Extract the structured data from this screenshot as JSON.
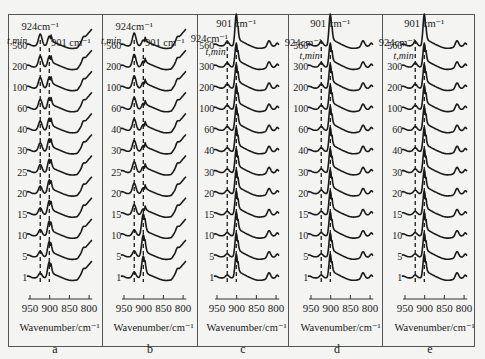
{
  "figure": {
    "x_axis_label": "Wavenumber/cm⁻¹",
    "x_ticks": [
      "950",
      "900",
      "850",
      "800"
    ],
    "time_header": "t,min",
    "peak_924_label": "924cm⁻¹",
    "peak_901_label": "901 cm⁻¹"
  },
  "panels": [
    {
      "letter": "a",
      "times": [
        "560",
        "200",
        "100",
        "60",
        "40",
        "30",
        "25",
        "20",
        "15",
        "10",
        "5",
        "1"
      ],
      "peak_924_rel": 1.0,
      "peak_901_rel": 0.7,
      "tail_rise": 1.0,
      "header_style": "924-top"
    },
    {
      "letter": "b",
      "times": [
        "560",
        "200",
        "100",
        "60",
        "40",
        "30",
        "25",
        "20",
        "15",
        "10",
        "5",
        "1"
      ],
      "peak_924_rel": 1.0,
      "peak_901_rel": 0.5,
      "tail_rise": 1.0,
      "header_style": "924-top"
    },
    {
      "letter": "c",
      "times": [
        "560",
        "300",
        "200",
        "100",
        "60",
        "40",
        "30",
        "20",
        "15",
        "10",
        "5",
        "1"
      ],
      "peak_924_rel": 0.3,
      "peak_901_rel": 1.0,
      "tail_rise": 0.3,
      "header_style": "901-top"
    },
    {
      "letter": "d",
      "times": [
        "560",
        "300",
        "200",
        "100",
        "60",
        "40",
        "30",
        "20",
        "15",
        "10",
        "5",
        "1"
      ],
      "peak_924_rel": 0.3,
      "peak_901_rel": 1.0,
      "tail_rise": 0.4,
      "header_style": "901-top"
    },
    {
      "letter": "e",
      "times": [
        "560",
        "300",
        "200",
        "100",
        "60",
        "40",
        "30",
        "20",
        "15",
        "10",
        "5",
        "1"
      ],
      "peak_924_rel": 0.3,
      "peak_901_rel": 1.0,
      "tail_rise": 0.4,
      "header_style": "901-top"
    }
  ],
  "chart_data": [
    {
      "type": "line",
      "title": "a",
      "xlabel": "Wavenumber/cm⁻¹",
      "ylabel": "t,min (stacked spectra)",
      "xlim": [
        960,
        790
      ],
      "x_ticks": [
        950,
        900,
        850,
        800
      ],
      "series_labels": [
        "560",
        "200",
        "100",
        "60",
        "40",
        "30",
        "25",
        "20",
        "15",
        "10",
        "5",
        "1"
      ],
      "annotations": [
        "924cm⁻¹",
        "901 cm⁻¹"
      ],
      "notes": "924 cm-1 band grows with time and dominates at long times; 901 cm-1 band strong at early times; dashed lines mark 924 and 901"
    },
    {
      "type": "line",
      "title": "b",
      "xlabel": "Wavenumber/cm⁻¹",
      "xlim": [
        960,
        790
      ],
      "x_ticks": [
        950,
        900,
        850,
        800
      ],
      "series_labels": [
        "560",
        "200",
        "100",
        "60",
        "40",
        "30",
        "25",
        "20",
        "15",
        "10",
        "5",
        "1"
      ],
      "annotations": [
        "924cm⁻¹",
        "901 cm⁻¹"
      ],
      "notes": "901 cm-1 dominant for t<=10 min; 924 cm-1 dominant for t>=15 min"
    },
    {
      "type": "line",
      "title": "c",
      "xlabel": "Wavenumber/cm⁻¹",
      "xlim": [
        960,
        790
      ],
      "x_ticks": [
        950,
        900,
        850,
        800
      ],
      "series_labels": [
        "560",
        "300",
        "200",
        "100",
        "60",
        "40",
        "30",
        "20",
        "15",
        "10",
        "5",
        "1"
      ],
      "annotations": [
        "901 cm⁻¹",
        "924cm⁻¹"
      ],
      "notes": "901 cm-1 dominant at all times; weak 924 shoulder; secondary band near 815 cm-1"
    },
    {
      "type": "line",
      "title": "d",
      "xlabel": "Wavenumber/cm⁻¹",
      "xlim": [
        960,
        790
      ],
      "x_ticks": [
        950,
        900,
        850,
        800
      ],
      "series_labels": [
        "560",
        "300",
        "200",
        "100",
        "60",
        "40",
        "30",
        "20",
        "15",
        "10",
        "5",
        "1"
      ],
      "annotations": [
        "901 cm⁻¹",
        "924cm⁻¹"
      ],
      "notes": "901 cm-1 dominant at all times; band near 820 cm-1"
    },
    {
      "type": "line",
      "title": "e",
      "xlabel": "Wavenumber/cm⁻¹",
      "xlim": [
        960,
        790
      ],
      "x_ticks": [
        950,
        900,
        850,
        800
      ],
      "series_labels": [
        "560",
        "300",
        "200",
        "100",
        "60",
        "40",
        "30",
        "20",
        "15",
        "10",
        "5",
        "1"
      ],
      "annotations": [
        "901 cm⁻¹",
        "924cm⁻¹"
      ],
      "notes": "901 cm-1 dominant at all times; band near 820 cm-1"
    }
  ]
}
